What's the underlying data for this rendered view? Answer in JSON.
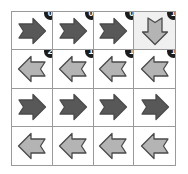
{
  "grid": {
    "rows": 4,
    "cols": 4,
    "colors": {
      "arrow_dark": "#585858",
      "arrow_light": "#b4b4b4",
      "arrow_outline": "#4a4a4a",
      "grid_line": "#9a9a9a",
      "cell_background": "#ffffff",
      "cell_highlight": "#f0f0f0",
      "badge_background": "#1c1c1c",
      "badge_text": "#ffffff"
    },
    "cells": [
      {
        "row": 0,
        "col": 0,
        "direction": "right",
        "shade": "dark",
        "badge": "0",
        "highlight": false
      },
      {
        "row": 0,
        "col": 1,
        "direction": "right",
        "shade": "dark",
        "badge": "0",
        "highlight": false
      },
      {
        "row": 0,
        "col": 2,
        "direction": "right",
        "shade": "dark",
        "badge": "0",
        "highlight": false
      },
      {
        "row": 0,
        "col": 3,
        "direction": "down",
        "shade": "light",
        "badge": "1",
        "highlight": true
      },
      {
        "row": 1,
        "col": 0,
        "direction": "left",
        "shade": "light",
        "badge": "2",
        "highlight": false
      },
      {
        "row": 1,
        "col": 1,
        "direction": "left",
        "shade": "light",
        "badge": "1",
        "highlight": false
      },
      {
        "row": 1,
        "col": 2,
        "direction": "left",
        "shade": "light",
        "badge": "1",
        "highlight": false
      },
      {
        "row": 1,
        "col": 3,
        "direction": "left",
        "shade": "light",
        "badge": "1",
        "highlight": false
      },
      {
        "row": 2,
        "col": 0,
        "direction": "right",
        "shade": "dark",
        "badge": null,
        "highlight": false
      },
      {
        "row": 2,
        "col": 1,
        "direction": "right",
        "shade": "dark",
        "badge": null,
        "highlight": false
      },
      {
        "row": 2,
        "col": 2,
        "direction": "right",
        "shade": "dark",
        "badge": null,
        "highlight": false
      },
      {
        "row": 2,
        "col": 3,
        "direction": "right",
        "shade": "dark",
        "badge": null,
        "highlight": false
      },
      {
        "row": 3,
        "col": 0,
        "direction": "left",
        "shade": "light",
        "badge": null,
        "highlight": false
      },
      {
        "row": 3,
        "col": 1,
        "direction": "left",
        "shade": "light",
        "badge": null,
        "highlight": false
      },
      {
        "row": 3,
        "col": 2,
        "direction": "left",
        "shade": "light",
        "badge": null,
        "highlight": false
      },
      {
        "row": 3,
        "col": 3,
        "direction": "left",
        "shade": "light",
        "badge": null,
        "highlight": false
      }
    ]
  }
}
